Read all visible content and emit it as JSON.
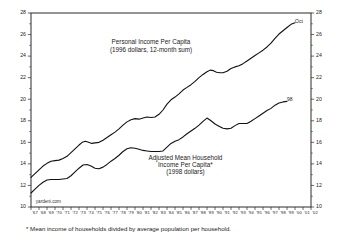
{
  "chart_data": {
    "type": "line",
    "title": "",
    "xlabel": "",
    "ylabel": "",
    "ylim": [
      10,
      28
    ],
    "xlim": [
      1967,
      2002
    ],
    "grid": false,
    "legend_position": "inline-annotation",
    "y_ticks": [
      10,
      12,
      14,
      16,
      18,
      20,
      22,
      24,
      26,
      28
    ],
    "y_ticks_right": [
      10,
      12,
      14,
      16,
      18,
      20,
      22,
      24,
      26,
      28
    ],
    "x_ticks": [
      "67",
      "68",
      "69",
      "70",
      "71",
      "72",
      "73",
      "74",
      "75",
      "76",
      "77",
      "78",
      "79",
      "80",
      "81",
      "82",
      "83",
      "84",
      "85",
      "86",
      "87",
      "88",
      "89",
      "90",
      "91",
      "92",
      "93",
      "94",
      "95",
      "96",
      "97",
      "98",
      "99",
      "00",
      "01",
      "02"
    ],
    "annotations": [
      {
        "name": "upper-series-label",
        "lines": [
          "Personal Income Per Capita",
          "(1996 dollars, 12-month sum)"
        ],
        "x": 1982.0,
        "y": 25.1
      },
      {
        "name": "lower-series-label",
        "lines": [
          "Adjusted Mean Household",
          "Income Per Capita*",
          "(1998 dollars)"
        ],
        "x": 1986.3,
        "y": 14.4
      },
      {
        "name": "upper-endpoint-label",
        "text": "Oct",
        "x": 2000.0,
        "y": 27.1
      },
      {
        "name": "lower-endpoint-label",
        "text": "98",
        "x": 1999.0,
        "y": 19.8
      },
      {
        "name": "watermark",
        "text": "yardeni.com",
        "x": 1967.6,
        "y": 10.4
      }
    ],
    "series": [
      {
        "name": "Personal Income Per Capita (1996 dollars, 12-month sum)",
        "x": [
          1967.0,
          1967.5,
          1968.0,
          1968.5,
          1969.0,
          1969.5,
          1970.0,
          1970.5,
          1971.0,
          1971.5,
          1972.0,
          1972.5,
          1973.0,
          1973.4,
          1973.8,
          1974.2,
          1974.6,
          1975.0,
          1975.5,
          1976.0,
          1976.5,
          1977.0,
          1977.5,
          1978.0,
          1978.5,
          1979.0,
          1979.5,
          1980.0,
          1980.5,
          1981.0,
          1981.5,
          1982.0,
          1982.5,
          1983.0,
          1983.5,
          1984.0,
          1984.5,
          1985.0,
          1985.5,
          1986.0,
          1986.5,
          1987.0,
          1987.5,
          1988.0,
          1988.5,
          1989.0,
          1989.4,
          1989.8,
          1990.2,
          1990.6,
          1991.0,
          1991.5,
          1992.0,
          1992.5,
          1993.0,
          1993.5,
          1994.0,
          1994.5,
          1995.0,
          1995.5,
          1996.0,
          1996.5,
          1997.0,
          1997.5,
          1998.0,
          1998.5,
          1999.0,
          1999.5,
          2000.0
        ],
        "y": [
          12.75,
          13.1,
          13.45,
          13.8,
          14.05,
          14.25,
          14.3,
          14.35,
          14.5,
          14.7,
          15.05,
          15.4,
          15.75,
          16.0,
          16.1,
          16.0,
          15.9,
          15.95,
          16.0,
          16.2,
          16.45,
          16.7,
          16.95,
          17.25,
          17.6,
          17.9,
          18.1,
          18.2,
          18.15,
          18.25,
          18.35,
          18.3,
          18.35,
          18.6,
          19.0,
          19.55,
          19.95,
          20.2,
          20.5,
          20.85,
          21.1,
          21.35,
          21.65,
          22.0,
          22.3,
          22.55,
          22.7,
          22.65,
          22.5,
          22.45,
          22.45,
          22.6,
          22.85,
          23.0,
          23.1,
          23.3,
          23.55,
          23.8,
          24.05,
          24.3,
          24.55,
          24.85,
          25.2,
          25.65,
          26.05,
          26.35,
          26.65,
          26.95,
          27.1
        ]
      },
      {
        "name": "Adjusted Mean Household Income Per Capita* (1998 dollars)",
        "x": [
          1967.0,
          1967.5,
          1968.0,
          1968.5,
          1969.0,
          1969.5,
          1970.0,
          1970.5,
          1971.0,
          1971.5,
          1972.0,
          1972.5,
          1973.0,
          1973.5,
          1974.0,
          1974.5,
          1975.0,
          1975.5,
          1976.0,
          1976.5,
          1977.0,
          1977.5,
          1978.0,
          1978.5,
          1979.0,
          1979.5,
          1980.0,
          1980.5,
          1981.0,
          1981.5,
          1982.0,
          1982.5,
          1983.0,
          1983.5,
          1984.0,
          1984.5,
          1985.0,
          1985.5,
          1986.0,
          1986.5,
          1987.0,
          1987.5,
          1988.0,
          1988.5,
          1989.0,
          1989.5,
          1990.0,
          1990.5,
          1991.0,
          1991.5,
          1992.0,
          1992.5,
          1993.0,
          1993.5,
          1994.0,
          1994.5,
          1995.0,
          1995.5,
          1996.0,
          1996.5,
          1997.0,
          1997.5,
          1998.0,
          1998.5,
          1999.0
        ],
        "y": [
          11.3,
          11.65,
          12.0,
          12.3,
          12.5,
          12.55,
          12.55,
          12.55,
          12.6,
          12.65,
          12.9,
          13.25,
          13.6,
          13.9,
          13.95,
          13.8,
          13.6,
          13.55,
          13.7,
          13.95,
          14.25,
          14.5,
          14.8,
          15.15,
          15.4,
          15.5,
          15.45,
          15.35,
          15.25,
          15.2,
          15.15,
          15.15,
          15.15,
          15.2,
          15.55,
          15.9,
          16.1,
          16.25,
          16.5,
          16.8,
          17.05,
          17.3,
          17.6,
          17.95,
          18.25,
          18.0,
          17.7,
          17.5,
          17.3,
          17.25,
          17.3,
          17.55,
          17.75,
          17.75,
          17.75,
          17.95,
          18.2,
          18.45,
          18.7,
          18.95,
          19.15,
          19.45,
          19.65,
          19.75,
          19.8
        ]
      }
    ]
  },
  "footnote": {
    "text": "* Mean income of households divided by average population per household."
  }
}
